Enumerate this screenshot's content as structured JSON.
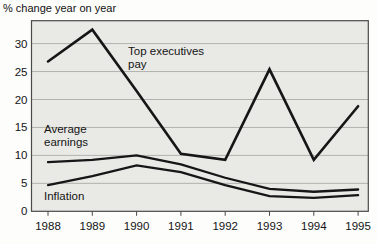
{
  "title": "% change year on year",
  "colors": {
    "plot_bg": "#e9e9e6",
    "line": "#161616",
    "grid": "#b2b2ae",
    "frame": "#4a4a48",
    "text": "#141414"
  },
  "chart_data": {
    "type": "line",
    "title": "% change year on year",
    "x": [
      "1988",
      "1989",
      "1990",
      "1991",
      "1992",
      "1993",
      "1994",
      "1995"
    ],
    "xlabel": "",
    "ylabel": "% change year on year",
    "ylim": [
      0,
      34
    ],
    "yticks": [
      0,
      5,
      10,
      15,
      20,
      25,
      30
    ],
    "grid": true,
    "legend": "in-plot labels",
    "series": [
      {
        "id": "top-executives-pay",
        "name": "Top executives pay",
        "values": [
          26.8,
          32.5,
          21.5,
          10.3,
          9.2,
          25.4,
          9.2,
          18.8
        ]
      },
      {
        "id": "average-earnings",
        "name": "Average earnings",
        "values": [
          8.8,
          9.2,
          10.0,
          8.4,
          6.0,
          4.0,
          3.5,
          3.9
        ]
      },
      {
        "id": "inflation",
        "name": "Inflation",
        "values": [
          4.7,
          6.3,
          8.2,
          7.0,
          4.7,
          2.7,
          2.4,
          2.9
        ]
      }
    ]
  }
}
